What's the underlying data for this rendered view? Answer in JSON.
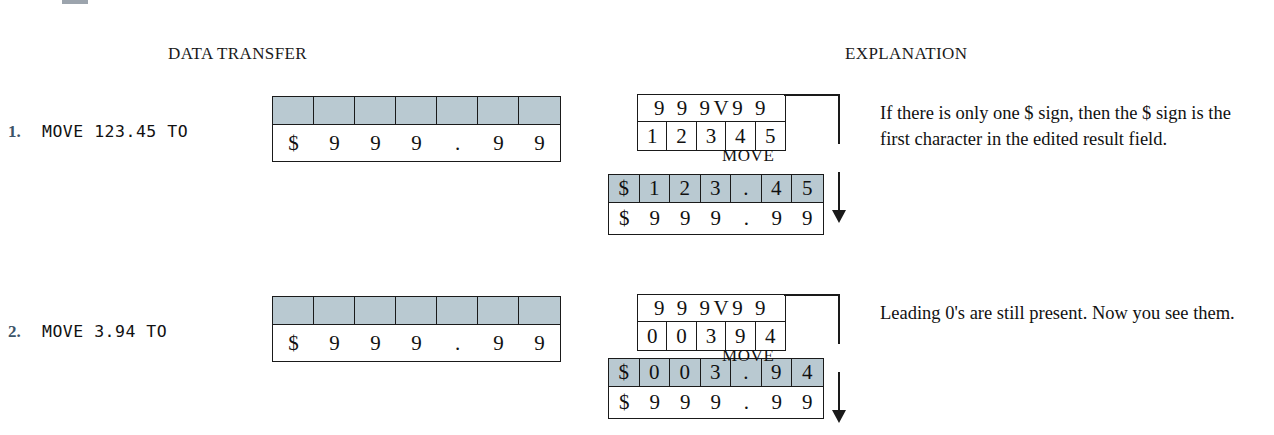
{
  "headers": {
    "data_transfer": "DATA TRANSFER",
    "explanation": "EXPLANATION"
  },
  "colors": {
    "shade": "#b9c9d1",
    "number_accent": "#3c5468",
    "ink": "#1a1a1a"
  },
  "connector": {
    "label": "MOVE"
  },
  "examples": [
    {
      "number": "1.",
      "statement": "MOVE 123.45 TO",
      "receiving_field": {
        "blank_cells": [
          "",
          "",
          "",
          "",
          "",
          "",
          ""
        ],
        "picture_cells": [
          "$",
          "9",
          "9",
          "9",
          ".",
          "9",
          "9"
        ]
      },
      "source_field": {
        "picture": "9 9 9V9 9",
        "value_cells": [
          "1",
          "2",
          "3",
          "4",
          "5"
        ]
      },
      "result_field": {
        "value_cells": [
          "$",
          "1",
          "2",
          "3",
          ".",
          "4",
          "5"
        ],
        "picture_cells": [
          "$",
          "9",
          "9",
          "9",
          ".",
          "9",
          "9"
        ]
      },
      "explanation": "If there is only one $ sign, then the $ sign is the first character in the edited result field."
    },
    {
      "number": "2.",
      "statement": "MOVE 3.94 TO",
      "receiving_field": {
        "blank_cells": [
          "",
          "",
          "",
          "",
          "",
          "",
          ""
        ],
        "picture_cells": [
          "$",
          "9",
          "9",
          "9",
          ".",
          "9",
          "9"
        ]
      },
      "source_field": {
        "picture": "9 9 9V9 9",
        "value_cells": [
          "0",
          "0",
          "3",
          "9",
          "4"
        ]
      },
      "result_field": {
        "value_cells": [
          "$",
          "0",
          "0",
          "3",
          ".",
          "9",
          "4"
        ],
        "picture_cells": [
          "$",
          "9",
          "9",
          "9",
          ".",
          "9",
          "9"
        ]
      },
      "explanation": "Leading 0's are still present. Now you see them."
    }
  ]
}
